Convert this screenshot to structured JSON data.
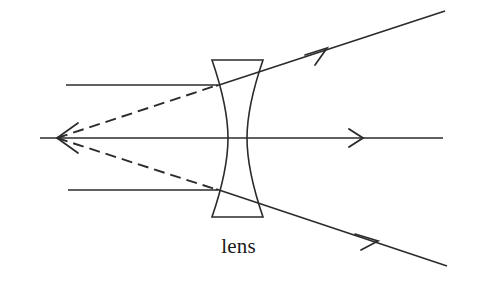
{
  "figure": {
    "title": "",
    "type": "optics-ray-diagram",
    "background_color": "#ffffff",
    "stroke_color": "#2b2b2b",
    "width": 477,
    "height": 282
  },
  "labels": {
    "lens": "lens",
    "lens_x": 237,
    "lens_y": 248
  },
  "lens": {
    "name": "lens",
    "shape": "biconcave",
    "top_left_x": 212,
    "top_right_x": 263,
    "top_y": 60,
    "bottom_left_x": 212,
    "bottom_right_x": 263,
    "bottom_y": 217,
    "waist_left_x": 228,
    "waist_right_x": 247,
    "center_y": 138
  },
  "focal_point": {
    "name": "virtual-focal-point",
    "x": 57,
    "y": 138
  },
  "axis": {
    "name": "optical-axis",
    "x_start": 40,
    "x_end": 443,
    "y": 138,
    "arrow_x": 360,
    "style": "solid"
  },
  "incident_rays": [
    {
      "name": "upper-incident-ray",
      "x_start": 66,
      "y_start": 85,
      "x_end": 217,
      "y_end": 85,
      "style": "solid"
    },
    {
      "name": "lower-incident-ray",
      "x_start": 68,
      "y_start": 190,
      "x_end": 217,
      "y_end": 190,
      "style": "solid"
    }
  ],
  "refracted_rays": [
    {
      "name": "upper-refracted-ray",
      "x_start": 217,
      "y_start": 85,
      "x_end": 445,
      "y_end": 11,
      "arrow_x": 326,
      "arrow_y": 50,
      "style": "solid"
    },
    {
      "name": "lower-refracted-ray",
      "x_start": 217,
      "y_start": 190,
      "x_end": 447,
      "y_end": 266,
      "arrow_x": 376,
      "arrow_y": 241,
      "style": "solid"
    }
  ],
  "virtual_rays": [
    {
      "name": "upper-virtual-ray",
      "x_start": 57,
      "y_start": 138,
      "x_end": 217,
      "y_end": 85,
      "style": "dashed",
      "dash": "11 6"
    },
    {
      "name": "lower-virtual-ray",
      "x_start": 57,
      "y_start": 138,
      "x_end": 217,
      "y_end": 190,
      "style": "dashed",
      "dash": "11 6"
    }
  ],
  "focal_arrow": {
    "name": "focal-point-arrowhead",
    "direction": "left",
    "tip_x": 57,
    "tip_y": 138,
    "tail_x": 75,
    "upper_y": 125,
    "lower_y": 151
  }
}
